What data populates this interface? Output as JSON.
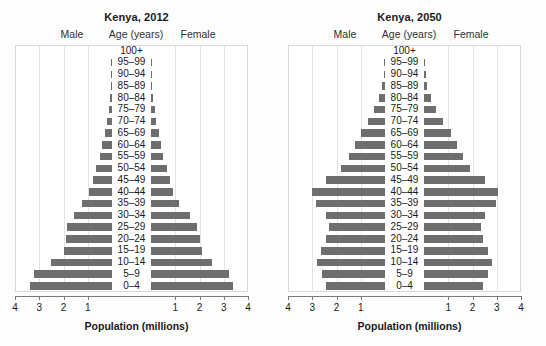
{
  "figure": {
    "background": "#fdfdfd",
    "bar_color": "#6e6e6e",
    "grid_color": "#e3e3e3",
    "axis_color": "#7a7a7a"
  },
  "shared": {
    "male_label": "Male",
    "female_label": "Female",
    "age_header": "Age (years)",
    "xaxis_title": "Population (millions)",
    "age_groups": [
      "100+",
      "95–99",
      "90–94",
      "85–89",
      "80–84",
      "75–79",
      "70–74",
      "65–69",
      "60–64",
      "55–59",
      "50–54",
      "45–49",
      "40–44",
      "35–39",
      "30–34",
      "25–29",
      "20–24",
      "15–19",
      "10–14",
      "5–9",
      "0–4"
    ],
    "tick_labels_left": [
      "4",
      "3",
      "2",
      "1"
    ],
    "tick_labels_right": [
      "1",
      "2",
      "3",
      "4"
    ],
    "xlim": [
      0,
      4
    ]
  },
  "chart_data": [
    {
      "type": "bar",
      "title": "Kenya, 2012",
      "subtype": "population-pyramid",
      "xlabel": "Population (millions)",
      "ylabel": "Age (years)",
      "xlim": [
        0,
        4
      ],
      "grid": true,
      "legend": "none",
      "categories": [
        "100+",
        "95–99",
        "90–94",
        "85–89",
        "80–84",
        "75–79",
        "70–74",
        "65–69",
        "60–64",
        "55–59",
        "50–54",
        "45–49",
        "40–44",
        "35–39",
        "30–34",
        "25–29",
        "20–24",
        "15–19",
        "10–14",
        "5–9",
        "0–4"
      ],
      "series": [
        {
          "name": "Male",
          "direction": "left",
          "values": [
            0.0,
            0.01,
            0.02,
            0.04,
            0.08,
            0.14,
            0.2,
            0.3,
            0.4,
            0.5,
            0.65,
            0.8,
            0.95,
            1.25,
            1.55,
            1.85,
            1.9,
            2.0,
            2.5,
            3.2,
            3.4
          ]
        },
        {
          "name": "Female",
          "direction": "right",
          "values": [
            0.0,
            0.01,
            0.02,
            0.05,
            0.09,
            0.15,
            0.22,
            0.32,
            0.42,
            0.5,
            0.65,
            0.78,
            0.9,
            1.15,
            1.6,
            1.9,
            2.0,
            2.1,
            2.5,
            3.2,
            3.4
          ]
        }
      ]
    },
    {
      "type": "bar",
      "title": "Kenya, 2050",
      "subtype": "population-pyramid",
      "xlabel": "Population (millions)",
      "ylabel": "Age (years)",
      "xlim": [
        0,
        4
      ],
      "grid": true,
      "legend": "none",
      "categories": [
        "100+",
        "95–99",
        "90–94",
        "85–89",
        "80–84",
        "75–79",
        "70–74",
        "65–69",
        "60–64",
        "55–59",
        "50–54",
        "45–49",
        "40–44",
        "35–39",
        "30–34",
        "25–29",
        "20–24",
        "15–19",
        "10–14",
        "5–9",
        "0–4"
      ],
      "series": [
        {
          "name": "Male",
          "direction": "left",
          "values": [
            0.0,
            0.02,
            0.05,
            0.12,
            0.25,
            0.45,
            0.7,
            1.0,
            1.25,
            1.5,
            1.8,
            2.45,
            3.0,
            2.85,
            2.45,
            2.3,
            2.45,
            2.65,
            2.8,
            2.6,
            2.45
          ]
        },
        {
          "name": "Female",
          "direction": "right",
          "values": [
            0.0,
            0.02,
            0.07,
            0.14,
            0.3,
            0.5,
            0.8,
            1.1,
            1.35,
            1.6,
            1.9,
            2.5,
            3.05,
            2.95,
            2.5,
            2.35,
            2.45,
            2.65,
            2.8,
            2.65,
            2.45
          ]
        }
      ]
    }
  ]
}
